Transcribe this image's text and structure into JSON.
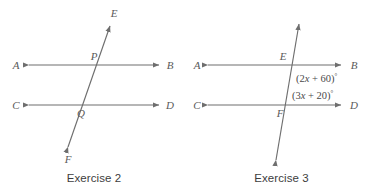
{
  "figures": [
    {
      "id": "exercise-2",
      "caption": "Exercise 2",
      "lines": {
        "line1": {
          "left_label": "A",
          "right_label": "B"
        },
        "line2": {
          "left_label": "C",
          "right_label": "D"
        },
        "transversal": {
          "top_label": "E",
          "bottom_label": "F"
        }
      },
      "intersections": [
        {
          "label": "P",
          "on_line": "AB"
        },
        {
          "label": "Q",
          "on_line": "CD"
        }
      ]
    },
    {
      "id": "exercise-3",
      "caption": "Exercise 3",
      "lines": {
        "line1": {
          "left_label": "A",
          "right_label": "B"
        },
        "line2": {
          "left_label": "C",
          "right_label": "D"
        },
        "transversal": {
          "top_label": "",
          "bottom_label": ""
        }
      },
      "intersections": [
        {
          "label": "E",
          "on_line": "AB"
        },
        {
          "label": "F",
          "on_line": "CD"
        }
      ],
      "angles": [
        {
          "name": "upper-angle",
          "open": "(",
          "coefficient": "2",
          "variable": "x",
          "operator": " + ",
          "constant": "60",
          "close": ")",
          "degree": "°",
          "text": "(2x + 60)°"
        },
        {
          "name": "lower-angle",
          "open": "(",
          "coefficient": "3",
          "variable": "x",
          "operator": " + ",
          "constant": "20",
          "close": ")",
          "degree": "°",
          "text": "(3x + 20)°"
        }
      ]
    }
  ],
  "colors": {
    "stroke": "#6e6e6e",
    "label": "#5a5a5a",
    "background": "#ffffff"
  }
}
